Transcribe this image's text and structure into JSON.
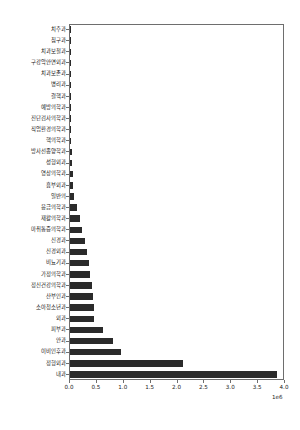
{
  "chart_data": {
    "type": "bar",
    "orientation": "horizontal",
    "title": "",
    "xlabel": "",
    "ylabel": "",
    "xlim": [
      0,
      4000000
    ],
    "exponent_label": "1e6",
    "grid": false,
    "legend": null,
    "bar_color": "#2b2b2b",
    "axis_color": "#6e6e6e",
    "xticks": [
      0,
      500000,
      1000000,
      1500000,
      2000000,
      2500000,
      3000000,
      3500000,
      4000000
    ],
    "xtick_labels": [
      "0.0",
      "0.5",
      "1.0",
      "1.5",
      "2.0",
      "2.5",
      "3.0",
      "3.5",
      "4.0"
    ],
    "categories": [
      "치주과",
      "침구과",
      "치과보철과",
      "구강악안면외과",
      "치과보존과",
      "병리과",
      "결핵과",
      "예방의학과",
      "진단검사의학과",
      "직업환경의학과",
      "핵의학과",
      "방사선종양학과",
      "성형외과",
      "영상의학과",
      "흉부외과",
      "일반의",
      "응급의학과",
      "재활의학과",
      "마취통증의학과",
      "신경과",
      "신경외과",
      "비뇨기과",
      "가정의학과",
      "정신건강의학과",
      "산부인과",
      "소아청소년과",
      "외과",
      "피부과",
      "안과",
      "이비인후과",
      "정형외과",
      "내과"
    ],
    "values": [
      2000,
      3000,
      4000,
      6000,
      7000,
      9000,
      11000,
      13000,
      16000,
      19000,
      24000,
      30000,
      42000,
      48000,
      55000,
      80000,
      135000,
      185000,
      225000,
      270000,
      310000,
      355000,
      375000,
      400000,
      435000,
      440000,
      445000,
      620000,
      800000,
      945000,
      2100000,
      3850000
    ]
  }
}
